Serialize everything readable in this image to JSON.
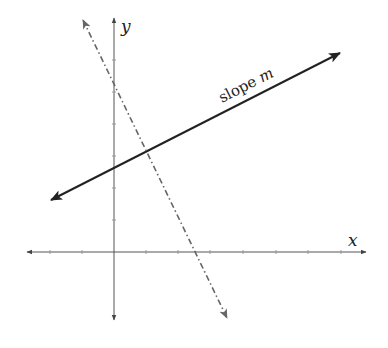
{
  "diagram": {
    "type": "coordinate-plane-lines",
    "axes": {
      "x_label": "x",
      "y_label": "y",
      "origin_px": [
        114,
        252
      ],
      "x_range_px": [
        27,
        366
      ],
      "y_range_px": [
        18,
        320
      ],
      "tick_spacing_px": 32,
      "color": "#555555"
    },
    "lines": [
      {
        "name": "slope-m-line",
        "style": "solid",
        "color": "#222222",
        "from_px": [
          51,
          200
        ],
        "to_px": [
          340,
          53
        ],
        "label": "slope ",
        "label_var": "m"
      },
      {
        "name": "perpendicular-line",
        "style": "dash-dot",
        "color": "#666666",
        "from_px": [
          83,
          20
        ],
        "to_px": [
          227,
          318
        ]
      }
    ]
  }
}
